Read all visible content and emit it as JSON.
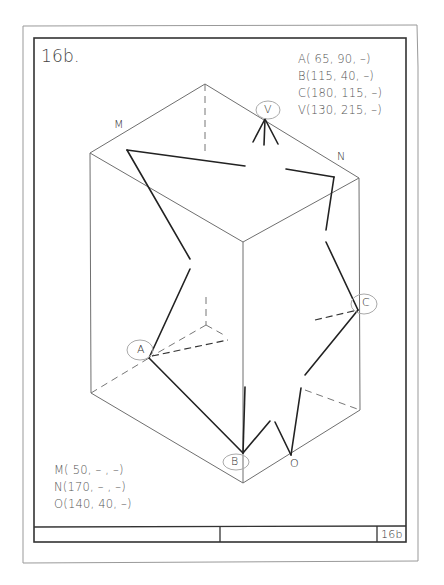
{
  "sheet": {
    "title": "16b.",
    "title_block_number": "16b"
  },
  "given_points_top": [
    "A( 65, 90, –)",
    "B(115, 40, –)",
    "C(180, 115, –)",
    "V(130, 215, –)"
  ],
  "given_points_bottom": [
    "M( 50, – , –)",
    "N(170, – , –)",
    "O(140, 40, –)"
  ],
  "point_labels": {
    "A": "A",
    "B": "B",
    "C": "C",
    "V": "V",
    "M": "M",
    "N": "N",
    "O": "O"
  },
  "colors": {
    "ink": "#222222",
    "box_line": "#777777",
    "pencil_circle": "#aaaaaa",
    "frame": "#333333"
  }
}
